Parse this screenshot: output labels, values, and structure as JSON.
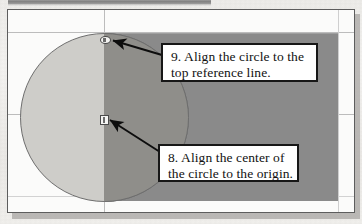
{
  "figure": {
    "type": "cad-alignment-illustration",
    "colors": {
      "viewport_fill": "#8a8a8a",
      "circle_fill_light": "#cecdc9",
      "circle_fill_overlap": "#8f8e8a",
      "circle_outline": "#6e6e6e",
      "callout_border": "#171717",
      "callout_fill": "#ffffff",
      "arrow": "#0d0d0d",
      "reference_line": "#bcbcbc",
      "panel_border": "#5d5d5d",
      "panel_fill": "#fbfbfa",
      "paper": "#f0efec",
      "shadow": "#a8a6a3",
      "top_bar": "#7b7b7b"
    }
  },
  "callouts": [
    {
      "id": "callout-9",
      "number": "9.",
      "line1": "9. Align the circle to the",
      "line2": "top reference line.",
      "full_text": "9. Align the circle to the top reference line.",
      "arrow_target": "circle-top-handle"
    },
    {
      "id": "callout-8",
      "number": "8.",
      "line1": "8. Align the center of",
      "line2": "the circle to the origin.",
      "full_text": "8. Align the center of the circle to the origin.",
      "arrow_target": "circle-center-handle"
    }
  ],
  "handles": {
    "top": {
      "name": "circle-top-handle",
      "shape": "oval"
    },
    "center": {
      "name": "circle-center-handle",
      "shape": "square"
    }
  },
  "reference_lines": {
    "top": {
      "name": "top-reference-line",
      "orientation": "horizontal"
    },
    "origin_horizontal": {
      "name": "origin-horizontal-line",
      "orientation": "horizontal"
    },
    "origin_vertical": {
      "name": "origin-vertical-line",
      "orientation": "vertical"
    }
  }
}
